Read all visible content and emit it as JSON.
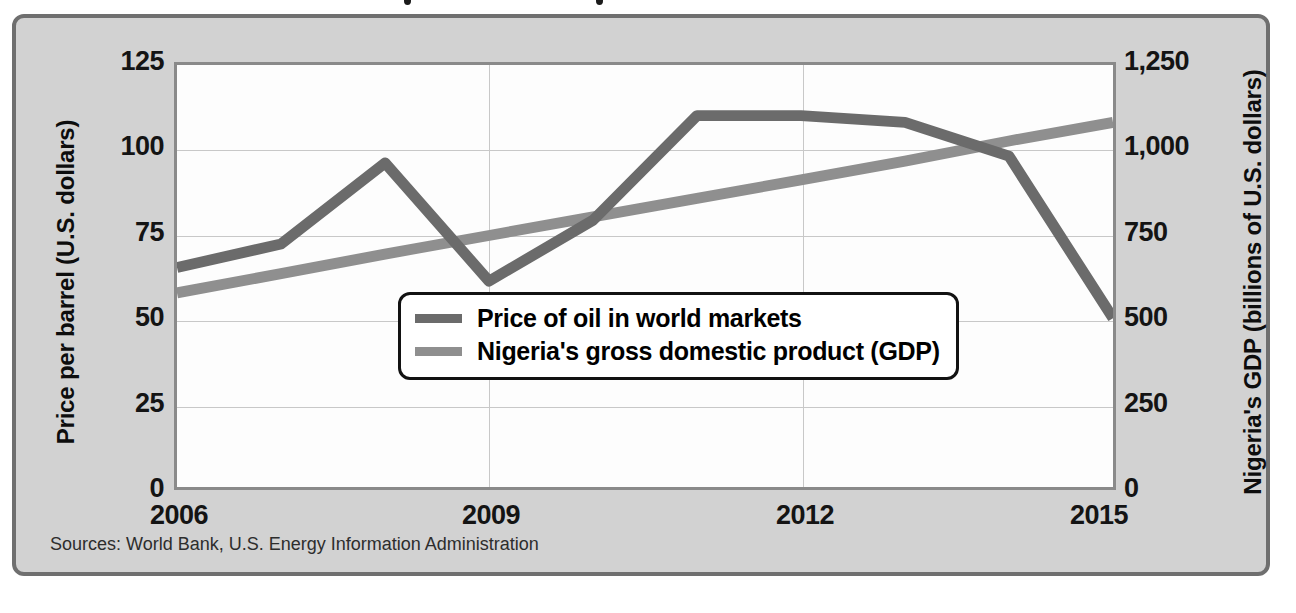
{
  "figure": {
    "source_note": "Sources: World Bank, U.S. Energy Information Administration",
    "frame_color": "#6f6f6f",
    "panel_background": "#d2d2d2",
    "plot_background": "#fdfdfd"
  },
  "chart_data": {
    "type": "line",
    "title": "",
    "xlabel": "",
    "x": [
      2006,
      2007,
      2008,
      2009,
      2010,
      2011,
      2012,
      2013,
      2014,
      2015
    ],
    "xticks": [
      "2006",
      "2009",
      "2012",
      "2015"
    ],
    "xtick_values": [
      2006,
      2009,
      2012,
      2015
    ],
    "xlim": [
      2006,
      2015
    ],
    "grid": true,
    "legend_position": "center",
    "axes": [
      {
        "id": "left",
        "ylabel": "Price per barrel (U.S. dollars)",
        "yticks": [
          "0",
          "25",
          "50",
          "75",
          "100",
          "125"
        ],
        "ytick_values": [
          0,
          25,
          50,
          75,
          100,
          125
        ],
        "ylim": [
          0,
          125
        ]
      },
      {
        "id": "right",
        "ylabel": "Nigeria's GDP (billions of U.S. dollars)",
        "yticks": [
          "0",
          "250",
          "500",
          "750",
          "1,000",
          "1,250"
        ],
        "ytick_values": [
          0,
          250,
          500,
          750,
          1000,
          1250
        ],
        "ylim": [
          0,
          1250
        ]
      }
    ],
    "series": [
      {
        "name": "Price of oil in world markets",
        "axis": "left",
        "color": "#6b6b6b",
        "values": [
          65,
          72,
          96,
          61,
          79,
          110,
          110,
          108,
          98,
          50
        ]
      },
      {
        "name": "Nigeria's gross domestic product (GDP)",
        "axis": "right",
        "color": "#8f8f8f",
        "values": [
          575,
          632,
          690,
          745,
          800,
          855,
          910,
          965,
          1025,
          1080
        ]
      }
    ]
  },
  "legend": {
    "items": [
      {
        "label": "Price of oil in world markets",
        "color": "#6b6b6b"
      },
      {
        "label": "Nigeria's gross domestic product (GDP)",
        "color": "#8f8f8f"
      }
    ]
  }
}
